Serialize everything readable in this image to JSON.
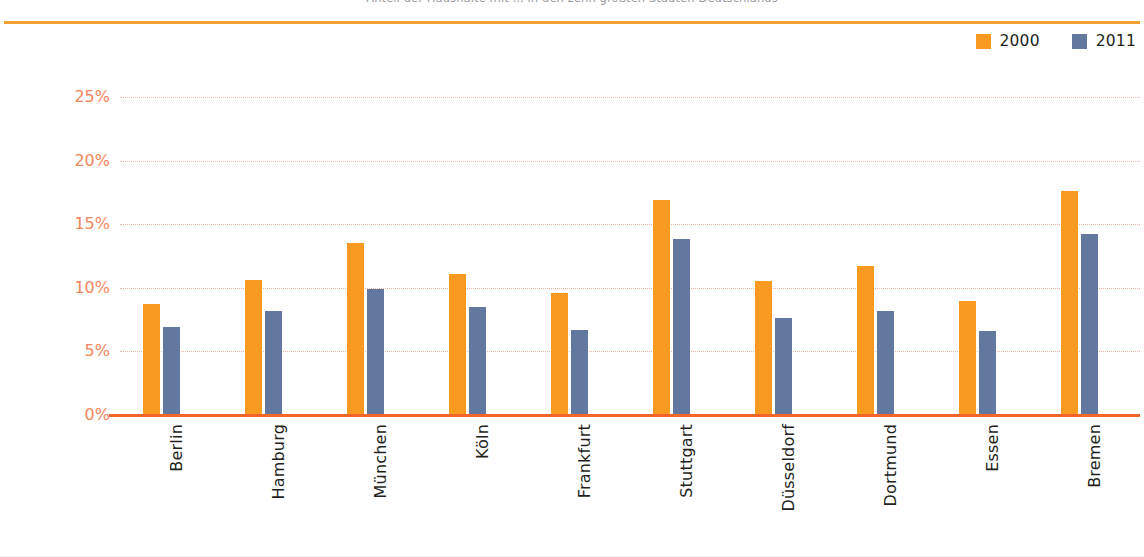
{
  "header": {
    "title_clipped": "Anteil der Haushalte mit ... in den zehn größten Städten Deutschlands"
  },
  "legend": {
    "position": "top-right",
    "items": [
      {
        "label": "2000",
        "color": "#F89A20",
        "swatch_name": "legend-swatch-2000"
      },
      {
        "label": "2011",
        "color": "#63789F",
        "swatch_name": "legend-swatch-2011"
      }
    ]
  },
  "axis": {
    "y_ticks": [
      "0%",
      "5%",
      "10%",
      "15%",
      "20%",
      "25%"
    ],
    "y_tick_color": "#F4855C",
    "gridline_color": "#F2B7A2",
    "baseline_color": "#F2682A",
    "top_rule_color": "#F5A033"
  },
  "chart_data": {
    "type": "bar",
    "title": "",
    "xlabel": "",
    "ylabel": "",
    "ylim": [
      0,
      25
    ],
    "ytick_values": [
      0,
      5,
      10,
      15,
      20,
      25
    ],
    "ytick_labels": [
      "0%",
      "5%",
      "10%",
      "15%",
      "20%",
      "25%"
    ],
    "grid": true,
    "legend_position": "top-right",
    "categories": [
      "Berlin",
      "Hamburg",
      "München",
      "Köln",
      "Frankfurt",
      "Stuttgart",
      "Düsseldorf",
      "Dortmund",
      "Essen",
      "Bremen"
    ],
    "series": [
      {
        "name": "2000",
        "color": "#F89A20",
        "values": [
          8.7,
          10.6,
          13.5,
          11.1,
          9.6,
          16.9,
          10.5,
          11.7,
          9.0,
          17.6
        ]
      },
      {
        "name": "2011",
        "color": "#63789F",
        "values": [
          6.9,
          8.2,
          9.9,
          8.5,
          6.7,
          13.8,
          7.6,
          8.2,
          6.6,
          14.2
        ]
      }
    ]
  }
}
